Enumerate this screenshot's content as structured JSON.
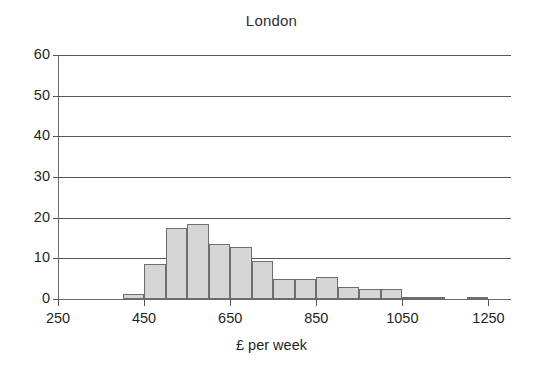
{
  "chart_data": {
    "type": "bar",
    "title": "London",
    "xlabel": "£ per week",
    "ylabel": "",
    "xlim": [
      250,
      1300
    ],
    "ylim": [
      0,
      60
    ],
    "grid": true,
    "legend": null,
    "bin_width": 50,
    "xticks": [
      250,
      450,
      650,
      850,
      1050,
      1250
    ],
    "xtick_labels": [
      "250",
      "450",
      "650",
      "850",
      "1050",
      "1250"
    ],
    "yticks": [
      0,
      10,
      20,
      30,
      40,
      50,
      60
    ],
    "ytick_labels": [
      "0",
      "10",
      "20",
      "30",
      "40",
      "50",
      "60"
    ],
    "bin_starts": [
      400,
      450,
      500,
      550,
      600,
      650,
      700,
      750,
      800,
      850,
      900,
      950,
      1000,
      1050,
      1100,
      1150,
      1200
    ],
    "categories": [
      "400-450",
      "450-500",
      "500-550",
      "550-600",
      "600-650",
      "650-700",
      "700-750",
      "750-800",
      "800-850",
      "850-900",
      "900-950",
      "950-1000",
      "1000-1050",
      "1050-1100",
      "1100-1150",
      "1150-1200",
      "1200-1250"
    ],
    "values": [
      1.3,
      8.5,
      17.5,
      18.5,
      13.5,
      12.8,
      9.3,
      5.0,
      4.8,
      5.5,
      3.0,
      2.5,
      2.5,
      0.5,
      0.5,
      0,
      0.5
    ],
    "bar_fill_color": "#d6d6d6",
    "bar_edge_color": "#6e6e6e",
    "axis_color": "#575757",
    "text_color": "#1f1f1f"
  }
}
